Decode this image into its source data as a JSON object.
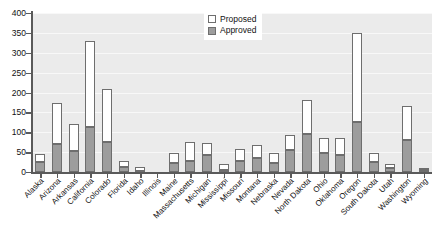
{
  "chart_data": {
    "type": "bar",
    "title": "",
    "xlabel": "",
    "ylabel": "",
    "ylim": [
      0,
      400
    ],
    "yticks": [
      0,
      50,
      100,
      150,
      200,
      250,
      300,
      350,
      400
    ],
    "grid": true,
    "stacked": true,
    "legend_position": "top-right",
    "categories": [
      "Alaska",
      "Arizona",
      "Arkansas",
      "California",
      "Colorado",
      "Florida",
      "Idaho",
      "Illinois",
      "Maine",
      "Massachusetts",
      "Michigan",
      "Mississippi",
      "Missouri",
      "Montana",
      "Nebraska",
      "Nevada",
      "North Dakota",
      "Ohio",
      "Oklahoma",
      "Oregon",
      "South Dakota",
      "Utah",
      "Washington",
      "Wyoming"
    ],
    "series": [
      {
        "name": "Approved",
        "color": "#9d9d9d",
        "values": [
          24,
          71,
          52,
          112,
          76,
          12,
          3,
          0,
          23,
          28,
          42,
          4,
          27,
          36,
          22,
          56,
          95,
          47,
          43,
          125,
          24,
          11,
          80,
          5
        ]
      },
      {
        "name": "Proposed",
        "color": "#ffffff",
        "values": [
          22,
          102,
          68,
          218,
          134,
          15,
          10,
          0,
          25,
          47,
          31,
          17,
          30,
          33,
          27,
          36,
          85,
          38,
          43,
          225,
          23,
          8,
          85,
          4
        ]
      }
    ],
    "totals": [
      46,
      173,
      120,
      330,
      210,
      27,
      13,
      0,
      48,
      75,
      73,
      21,
      57,
      69,
      49,
      92,
      180,
      85,
      86,
      350,
      47,
      19,
      165,
      9
    ]
  },
  "legend": {
    "items": [
      {
        "label": "Proposed",
        "swatch": "proposed"
      },
      {
        "label": "Approved",
        "swatch": "approved"
      }
    ]
  },
  "axes": {
    "y_tick_labels": [
      "400",
      "350",
      "300",
      "250",
      "200",
      "150",
      "100",
      "50",
      "0"
    ]
  }
}
